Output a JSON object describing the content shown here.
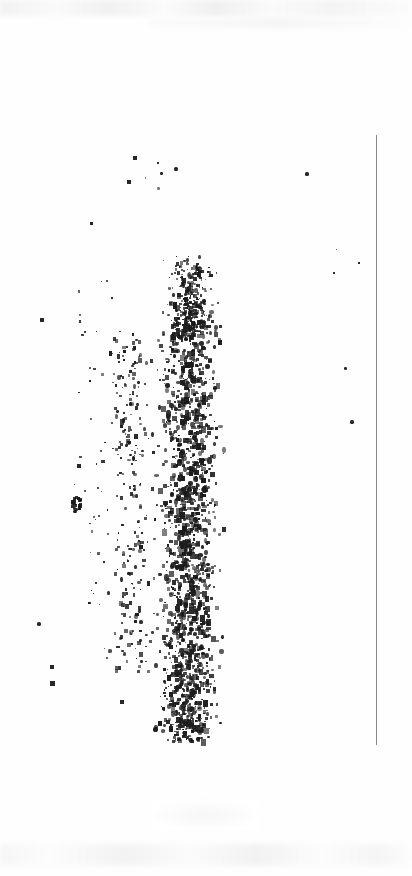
{
  "document": {
    "kind": "scanned-page",
    "title": "Degraded scanned page",
    "legible_text": "",
    "note": "No legible text present; page content is ink speckle noise"
  },
  "page": {
    "width": 412,
    "height": 876,
    "background_color": "#fefefe",
    "ink_color": "#1b1b1b"
  },
  "rule": {
    "name": "right-margin-rule",
    "x": 376,
    "y_start": 135,
    "y_end": 745,
    "thickness": 1,
    "color": "#8a8a8a"
  },
  "ghosts": [
    {
      "name": "top-bleed-band",
      "x": 0,
      "y": 0,
      "width": 412,
      "height": 16,
      "color": "#f2f2f3"
    },
    {
      "name": "top-bleed-band-2",
      "x": 150,
      "y": 18,
      "width": 260,
      "height": 10,
      "color": "#f7f7f8"
    },
    {
      "name": "mid-bottom-smudge",
      "x": 150,
      "y": 800,
      "width": 110,
      "height": 30,
      "color": "#f6f6f7"
    },
    {
      "name": "bottom-bleed-band",
      "x": 0,
      "y": 844,
      "width": 412,
      "height": 22,
      "color": "#f5f5f6"
    }
  ],
  "speckle_field": {
    "description": "Vertical column of dense ink speckles with sparse outliers",
    "seed": 20240513,
    "ink_color": "#1b1b1b",
    "clusters": [
      {
        "name": "dense-core",
        "x": 150,
        "y": 300,
        "width": 75,
        "height": 440,
        "count": 1500,
        "min_size": 1,
        "max_size": 5,
        "density": 1.0
      },
      {
        "name": "dense-upper",
        "x": 158,
        "y": 255,
        "width": 62,
        "height": 80,
        "count": 220,
        "min_size": 1,
        "max_size": 4,
        "density": 0.9
      },
      {
        "name": "mid-left-band",
        "x": 95,
        "y": 330,
        "width": 70,
        "height": 340,
        "count": 430,
        "min_size": 1,
        "max_size": 4,
        "density": 0.6
      },
      {
        "name": "left-sparse",
        "x": 55,
        "y": 280,
        "width": 70,
        "height": 330,
        "count": 120,
        "min_size": 1,
        "max_size": 3,
        "density": 0.3
      },
      {
        "name": "lower-tail",
        "x": 150,
        "y": 650,
        "width": 70,
        "height": 90,
        "count": 200,
        "min_size": 1,
        "max_size": 4,
        "density": 0.7
      },
      {
        "name": "upper-wisps",
        "x": 118,
        "y": 150,
        "width": 70,
        "height": 40,
        "count": 18,
        "min_size": 1,
        "max_size": 3,
        "density": 0.2
      },
      {
        "name": "far-right-trace",
        "x": 290,
        "y": 160,
        "width": 80,
        "height": 280,
        "count": 8,
        "min_size": 1,
        "max_size": 3,
        "density": 0.1
      },
      {
        "name": "far-left-trace",
        "x": 25,
        "y": 300,
        "width": 45,
        "height": 400,
        "count": 10,
        "min_size": 2,
        "max_size": 4,
        "density": 0.1
      }
    ],
    "notable_marks": [
      {
        "name": "triangle-blob",
        "x": 65,
        "y": 495,
        "size": 14
      },
      {
        "name": "speck-upper-right",
        "x": 305,
        "y": 172,
        "size": 4
      },
      {
        "name": "speck-right-mid",
        "x": 358,
        "y": 262,
        "size": 2
      },
      {
        "name": "speck-right-low",
        "x": 344,
        "y": 367,
        "size": 3
      },
      {
        "name": "speck-right-lower",
        "x": 350,
        "y": 420,
        "size": 4
      },
      {
        "name": "speck-left-a",
        "x": 37,
        "y": 622,
        "size": 4
      },
      {
        "name": "speck-left-b",
        "x": 50,
        "y": 665,
        "size": 4
      },
      {
        "name": "speck-left-c",
        "x": 50,
        "y": 681,
        "size": 5
      },
      {
        "name": "speck-left-d",
        "x": 40,
        "y": 318,
        "size": 4
      },
      {
        "name": "speck-left-e",
        "x": 77,
        "y": 464,
        "size": 4
      },
      {
        "name": "speck-mid-low",
        "x": 120,
        "y": 700,
        "size": 4
      },
      {
        "name": "speck-top-a",
        "x": 133,
        "y": 156,
        "size": 4
      },
      {
        "name": "speck-top-b",
        "x": 127,
        "y": 180,
        "size": 4
      },
      {
        "name": "speck-top-c",
        "x": 160,
        "y": 172,
        "size": 3
      },
      {
        "name": "speck-top-f",
        "x": 174,
        "y": 167,
        "size": 4
      },
      {
        "name": "speck-upper-left",
        "x": 90,
        "y": 222,
        "size": 3
      }
    ]
  }
}
